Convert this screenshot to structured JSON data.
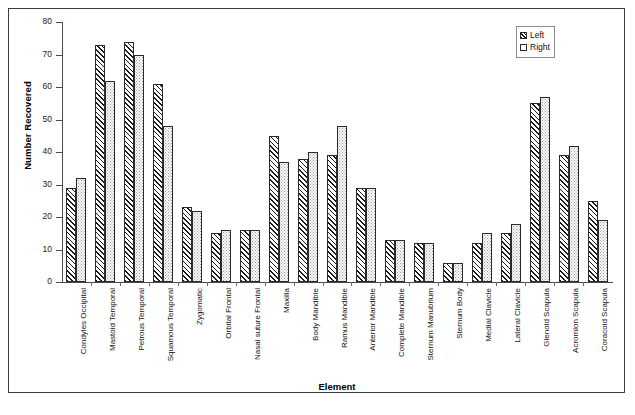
{
  "chart_data": {
    "type": "bar",
    "title": "",
    "xlabel": "Element",
    "ylabel": "Number Recovered",
    "ylim": [
      0,
      80
    ],
    "yticks": [
      0,
      10,
      20,
      30,
      40,
      50,
      60,
      70,
      80
    ],
    "grid": false,
    "legend_position": "top-right",
    "categories": [
      "Condyles Occipital",
      "Mastoid Temporal",
      "Petrous Temporal",
      "Squamous Temporal",
      "Zygomatic",
      "Orbital Frontal",
      "Nasal suture Frontal",
      "Maxilla",
      "Body Mandible",
      "Ramus Mandible",
      "Anterior Mandible",
      "Complete Mandible",
      "Sternum Manubrium",
      "Sternum Body",
      "Medial Clavicle",
      "Lateral Clavicle",
      "Glenoid Scapula",
      "Acromion Scapula",
      "Coracoid Scapula"
    ],
    "series": [
      {
        "name": "Left",
        "pattern": "diagonal-hatch",
        "values": [
          29,
          73,
          74,
          61,
          23,
          15,
          16,
          45,
          38,
          39,
          29,
          13,
          12,
          6,
          12,
          15,
          55,
          39,
          25
        ]
      },
      {
        "name": "Right",
        "pattern": "dotted",
        "values": [
          32,
          62,
          70,
          48,
          22,
          16,
          16,
          37,
          40,
          48,
          29,
          13,
          12,
          6,
          15,
          18,
          57,
          42,
          19
        ]
      }
    ]
  },
  "legend": {
    "items": [
      {
        "label": "Left"
      },
      {
        "label": "Right"
      }
    ]
  }
}
